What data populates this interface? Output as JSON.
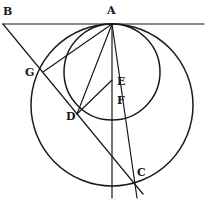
{
  "diagram": {
    "type": "geometric-figure",
    "colors": {
      "ink": "#1a1a1a",
      "background": "#ffffff"
    },
    "labels": {
      "B": "B",
      "A": "A",
      "G": "G",
      "E": "E",
      "F": "F",
      "D": "D",
      "C": "C"
    },
    "points": {
      "B": [
        3,
        24
      ],
      "A": [
        112,
        24
      ],
      "G": [
        43,
        72
      ],
      "D": [
        77,
        114
      ],
      "E": [
        113,
        80
      ],
      "F": [
        119,
        100
      ],
      "C": [
        133,
        180
      ]
    },
    "circles": [
      {
        "name": "large-circle",
        "cx": 112,
        "cy": 105,
        "r": 81
      },
      {
        "name": "small-circle",
        "cx": 112,
        "cy": 72,
        "r": 48
      }
    ]
  }
}
